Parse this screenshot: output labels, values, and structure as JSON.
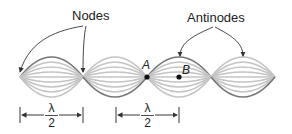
{
  "diagram": {
    "labels": {
      "nodes": "Nodes",
      "antinodes": "Antinodes",
      "point_a": "A",
      "point_b": "B"
    },
    "wavelength_marker": {
      "numerator": "λ",
      "denominator": "2"
    },
    "colors": {
      "wave_light": "#c4c4c4",
      "wave_dark": "#6e6e6e",
      "text": "#222222",
      "arrow": "#333333"
    },
    "node_x": [
      20,
      83,
      147,
      211,
      275
    ],
    "axis_y": 77,
    "amplitude": 20
  }
}
